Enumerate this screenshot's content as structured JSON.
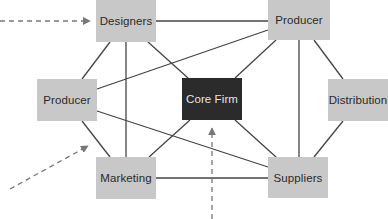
{
  "diagram": {
    "type": "network",
    "colors": {
      "node_fill": "#c8c8c8",
      "core_fill": "#2b2b2b",
      "core_text": "#e6e6e6",
      "node_text": "#2a2a2a",
      "line": "#444444",
      "dashed_arrow": "#777777",
      "background": "#ffffff"
    },
    "nodes": [
      {
        "id": "designers",
        "label": "Designers",
        "x": 96,
        "y": 0,
        "w": 60,
        "h": 42
      },
      {
        "id": "producer_top",
        "label": "Producer",
        "x": 268,
        "y": 0,
        "w": 62,
        "h": 40
      },
      {
        "id": "producer_left",
        "label": "Producer",
        "x": 37,
        "y": 79,
        "w": 60,
        "h": 42
      },
      {
        "id": "core_firm",
        "label": "Core Firm",
        "x": 182,
        "y": 78,
        "w": 60,
        "h": 42,
        "highlight": true
      },
      {
        "id": "distribution",
        "label": "Distribution",
        "x": 328,
        "y": 79,
        "w": 60,
        "h": 42
      },
      {
        "id": "marketing",
        "label": "Marketing",
        "x": 96,
        "y": 157,
        "w": 60,
        "h": 42
      },
      {
        "id": "suppliers",
        "label": "Suppliers",
        "x": 268,
        "y": 157,
        "w": 60,
        "h": 41
      }
    ],
    "edges": [
      {
        "from": "designers",
        "to": "producer_top"
      },
      {
        "from": "designers",
        "to": "producer_left"
      },
      {
        "from": "designers",
        "to": "marketing"
      },
      {
        "from": "designers",
        "to": "core_firm"
      },
      {
        "from": "producer_left",
        "to": "producer_top"
      },
      {
        "from": "producer_top",
        "to": "core_firm"
      },
      {
        "from": "producer_top",
        "to": "suppliers"
      },
      {
        "from": "producer_top",
        "to": "distribution"
      },
      {
        "from": "producer_left",
        "to": "marketing"
      },
      {
        "from": "producer_left",
        "to": "suppliers"
      },
      {
        "from": "core_firm",
        "to": "marketing"
      },
      {
        "from": "core_firm",
        "to": "suppliers"
      },
      {
        "from": "distribution",
        "to": "suppliers"
      },
      {
        "from": "marketing",
        "to": "suppliers"
      }
    ],
    "dashed_arrows": [
      {
        "target": "designers",
        "direction": "from-left"
      },
      {
        "target": "producer_left-marketing-edge",
        "direction": "from-bottom-left"
      },
      {
        "target": "core_firm",
        "direction": "from-bottom"
      }
    ]
  }
}
